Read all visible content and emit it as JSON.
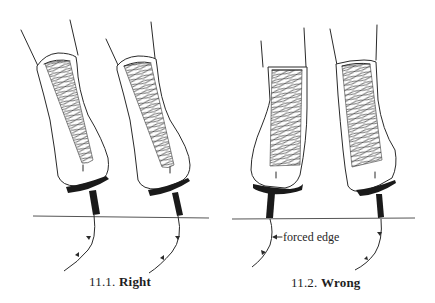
{
  "figure": {
    "panels": [
      {
        "id": "11.1",
        "caption_number": "11.1.",
        "caption_word": "Right",
        "description": "Both skates leaning into edges naturally; tracing curved outward"
      },
      {
        "id": "11.2",
        "caption_number": "11.2.",
        "caption_word": "Wrong",
        "description": "Skates upright with blade forced onto edge",
        "annotation": "forced edge"
      }
    ],
    "colors": {
      "ink": "#2a2a2a",
      "sole": "#1a1a1a",
      "background": "#ffffff"
    }
  }
}
